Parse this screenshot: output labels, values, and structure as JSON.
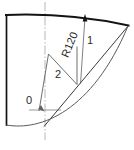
{
  "figure": {
    "type": "engineering-sector-drawing",
    "background": "#ffffff",
    "line_color": "#1a1a1a",
    "thin_line_color": "#6b6b6b",
    "centerline_color": "#8a8a8a",
    "text_color": "#2a2a2a",
    "caption": ""
  },
  "dimensions": {
    "radius_label": "R120"
  },
  "callouts": [
    {
      "id": "callout-0",
      "label": "0",
      "x": 27,
      "y": 100
    },
    {
      "id": "callout-1",
      "label": "1",
      "x": 92,
      "y": 40
    },
    {
      "id": "callout-2",
      "label": "2",
      "x": 57,
      "y": 74
    }
  ],
  "geometry": {
    "top_arc": "M 6,15 Q 70,13 128,25",
    "left_edge": "M 6,15 L 6,124",
    "right_radial": "M 128,25 L 45,126",
    "bottom_arc": "M 6,124 Q 70,130 128,25",
    "leader_1": "M 85,16 L 80,83",
    "zigzag_2": "M 39,110 L 48,54 L 77,84 L 77,46",
    "centerline": "M 45,2 L 45,140",
    "center_mark_h": "M 30,110 L 60,110",
    "arrow_tip_x": 85,
    "arrow_tip_y": 15
  }
}
